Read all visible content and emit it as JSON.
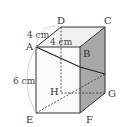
{
  "figure": {
    "type": "rectangular-prism",
    "vertices": {
      "A": "A",
      "B": "B",
      "C": "C",
      "D": "D",
      "E": "E",
      "F": "F",
      "G": "G",
      "H": "H"
    },
    "dimensions": {
      "AD": "4 cm",
      "AB": "4 cm",
      "AE": "6 cm"
    },
    "colors": {
      "edge": "#333333",
      "side_face": "#a8a8a8",
      "top_face": "#f0f0f0",
      "front_face": "#fafafa",
      "arc": "#c8c8c8"
    }
  }
}
